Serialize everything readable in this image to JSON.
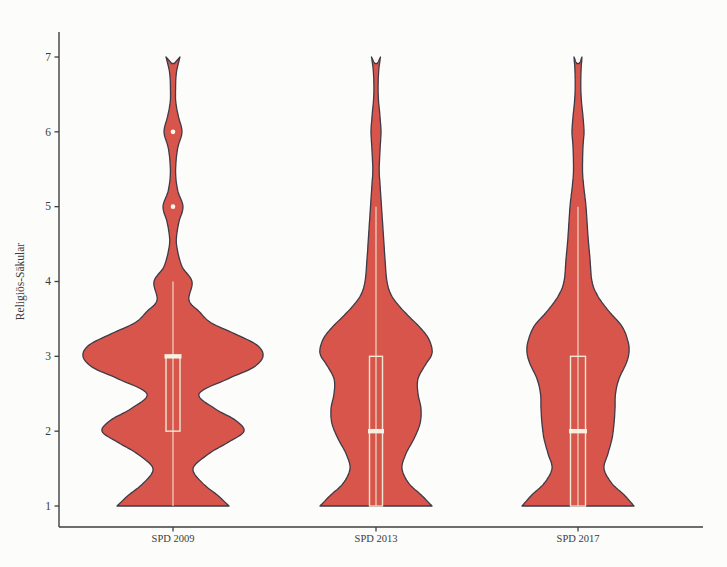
{
  "page": {
    "background": "#fcfcfa"
  },
  "colors": {
    "violin_fill": "#d7554a",
    "violin_stroke": "#3e3a47",
    "box_stroke": "#efe8d4",
    "median_color": "#f6f1e2",
    "outlier_dot_color": "#fbf8f0",
    "axis_color": "#3f3f3f",
    "text_color": "#3b3b3b"
  },
  "chart_data": {
    "type": "violin",
    "title": "",
    "xlabel": "",
    "ylabel": "Religiös-Säkular",
    "ylim": [
      1,
      7
    ],
    "y_ticks": [
      1,
      2,
      3,
      4,
      5,
      6,
      7
    ],
    "grid": "off",
    "legend": "none",
    "categories": [
      "SPD 2009",
      "SPD 2013",
      "SPD 2017"
    ],
    "violins": [
      {
        "label": "SPD 2009",
        "box": {
          "median": 3,
          "q1": 2,
          "q3": 3,
          "whisker_low": 1,
          "whisker_high": 4,
          "outliers": [
            5,
            6,
            7
          ]
        },
        "profile": [
          [
            1.0,
            56
          ],
          [
            1.15,
            44
          ],
          [
            1.3,
            30
          ],
          [
            1.5,
            20
          ],
          [
            1.7,
            36
          ],
          [
            1.85,
            55
          ],
          [
            2.0,
            71
          ],
          [
            2.15,
            62
          ],
          [
            2.3,
            42
          ],
          [
            2.5,
            26
          ],
          [
            2.7,
            55
          ],
          [
            2.85,
            80
          ],
          [
            3.0,
            90
          ],
          [
            3.15,
            84
          ],
          [
            3.3,
            62
          ],
          [
            3.45,
            38
          ],
          [
            3.6,
            26
          ],
          [
            3.75,
            16
          ],
          [
            4.0,
            19
          ],
          [
            4.2,
            9
          ],
          [
            4.45,
            4
          ],
          [
            4.6,
            3.5
          ],
          [
            4.8,
            6
          ],
          [
            5.0,
            10
          ],
          [
            5.2,
            5
          ],
          [
            5.4,
            2.8
          ],
          [
            5.6,
            3
          ],
          [
            5.8,
            5
          ],
          [
            6.0,
            9
          ],
          [
            6.2,
            5.5
          ],
          [
            6.4,
            2.8
          ],
          [
            6.6,
            2.6
          ],
          [
            6.8,
            3.5
          ],
          [
            7.0,
            7
          ]
        ]
      },
      {
        "label": "SPD 2013",
        "box": {
          "median": 2,
          "q1": 1,
          "q3": 3,
          "whisker_low": 1,
          "whisker_high": 5,
          "outliers": [
            7
          ]
        },
        "profile": [
          [
            1.0,
            56
          ],
          [
            1.15,
            45
          ],
          [
            1.3,
            33
          ],
          [
            1.5,
            26
          ],
          [
            1.7,
            30
          ],
          [
            1.9,
            38
          ],
          [
            2.1,
            44
          ],
          [
            2.3,
            45
          ],
          [
            2.5,
            42
          ],
          [
            2.7,
            42
          ],
          [
            2.9,
            50
          ],
          [
            3.0,
            55
          ],
          [
            3.1,
            56
          ],
          [
            3.25,
            52
          ],
          [
            3.4,
            43
          ],
          [
            3.6,
            28
          ],
          [
            3.8,
            16
          ],
          [
            4.0,
            11
          ],
          [
            4.3,
            9
          ],
          [
            4.6,
            7.5
          ],
          [
            5.0,
            5.5
          ],
          [
            5.3,
            4
          ],
          [
            5.5,
            3.2
          ],
          [
            5.8,
            4.2
          ],
          [
            6.0,
            5
          ],
          [
            6.2,
            4
          ],
          [
            6.5,
            2.2
          ],
          [
            6.8,
            2.6
          ],
          [
            7.0,
            4.5
          ]
        ]
      },
      {
        "label": "SPD 2017",
        "box": {
          "median": 2,
          "q1": 1,
          "q3": 3,
          "whisker_low": 1,
          "whisker_high": 5,
          "outliers": [
            7
          ]
        },
        "profile": [
          [
            1.0,
            56
          ],
          [
            1.15,
            46
          ],
          [
            1.3,
            34
          ],
          [
            1.5,
            26
          ],
          [
            1.7,
            30
          ],
          [
            1.9,
            34
          ],
          [
            2.1,
            36
          ],
          [
            2.3,
            37
          ],
          [
            2.5,
            37.5
          ],
          [
            2.7,
            41
          ],
          [
            2.9,
            48
          ],
          [
            3.05,
            51
          ],
          [
            3.2,
            50
          ],
          [
            3.4,
            44
          ],
          [
            3.6,
            31
          ],
          [
            3.8,
            20
          ],
          [
            4.0,
            14
          ],
          [
            4.3,
            12
          ],
          [
            4.6,
            10
          ],
          [
            5.0,
            8
          ],
          [
            5.3,
            5.5
          ],
          [
            5.5,
            4.5
          ],
          [
            5.8,
            5
          ],
          [
            6.0,
            6
          ],
          [
            6.2,
            5
          ],
          [
            6.5,
            3
          ],
          [
            6.8,
            3
          ],
          [
            7.0,
            4
          ]
        ]
      }
    ],
    "layout_hints": {
      "canvas": {
        "width": 727,
        "height": 567
      },
      "violin_centers_px": [
        173,
        376,
        578
      ],
      "y_value1_px": 506,
      "y_value7_px": 57,
      "axis_x_px": 59,
      "axis_y_px": 527,
      "axis_top_px": 32,
      "axis_right_px": 703,
      "box_halfwidths_px": [
        7,
        6.5,
        7.5
      ]
    }
  }
}
